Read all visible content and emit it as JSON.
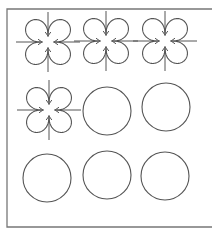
{
  "figure": {
    "frame": {
      "left": 7,
      "top": 9,
      "bottom": 227,
      "right": 212,
      "color": "#777777"
    },
    "stroke_color": "#555555",
    "cells": [
      {
        "type": "clover",
        "cx": 48,
        "cy": 42,
        "r": 24
      },
      {
        "type": "clover",
        "cx": 106,
        "cy": 41,
        "r": 24
      },
      {
        "type": "clover",
        "cx": 165,
        "cy": 41,
        "r": 24
      },
      {
        "type": "clover",
        "cx": 49,
        "cy": 110,
        "r": 24
      },
      {
        "type": "circle",
        "cx": 107,
        "cy": 111,
        "r": 24
      },
      {
        "type": "circle",
        "cx": 166,
        "cy": 107,
        "r": 24
      },
      {
        "type": "circle",
        "cx": 47,
        "cy": 178,
        "r": 24
      },
      {
        "type": "circle",
        "cx": 107,
        "cy": 175,
        "r": 24
      },
      {
        "type": "circle",
        "cx": 165,
        "cy": 176,
        "r": 24
      }
    ]
  }
}
